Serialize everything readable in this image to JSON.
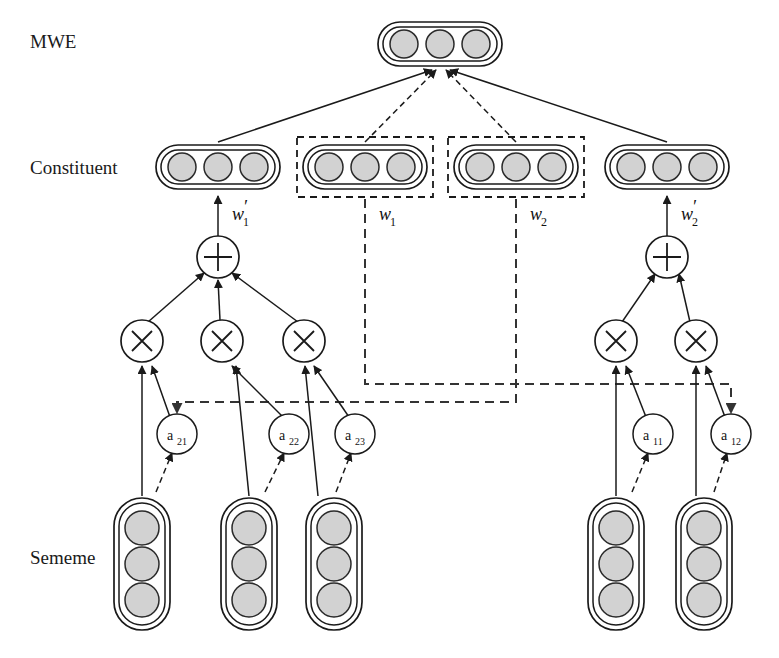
{
  "figure": {
    "background": "#ffffff",
    "width": 779,
    "height": 658
  },
  "colors": {
    "unit_fill": "#d2d2d2",
    "unit_stroke": "#2a2a2a",
    "line": "#1a1a1a",
    "dashed_route": "#333333",
    "background": "#ffffff"
  },
  "row_labels": {
    "mwe": "MWE",
    "constituent": "Constituent",
    "sememe": "Sememe"
  },
  "weights": {
    "w1_prime": {
      "base": "w",
      "prime": "′",
      "sub": "1",
      "full": "w′1"
    },
    "w1": {
      "base": "w",
      "prime": "",
      "sub": "1",
      "full": "w1"
    },
    "w2": {
      "base": "w",
      "prime": "",
      "sub": "2",
      "full": "w2"
    },
    "w2_prime": {
      "base": "w",
      "prime": "′",
      "sub": "2",
      "full": "w′2"
    }
  },
  "attention_nodes": [
    {
      "id": "a21",
      "base": "a",
      "sub": "21",
      "cx": 177,
      "cy": 434
    },
    {
      "id": "a22",
      "base": "a",
      "sub": "22",
      "cx": 289,
      "cy": 434
    },
    {
      "id": "a23",
      "base": "a",
      "sub": "23",
      "cx": 355,
      "cy": 434
    },
    {
      "id": "a11",
      "base": "a",
      "sub": "11",
      "cx": 653,
      "cy": 434
    },
    {
      "id": "a12",
      "base": "a",
      "sub": "12",
      "cx": 731,
      "cy": 434
    }
  ],
  "mwe_node": {
    "name": "mwe-vector",
    "cx": 440,
    "cy": 44,
    "units": 3
  },
  "constituent_nodes": [
    {
      "name": "constituent-left-composed",
      "cx": 218,
      "cy": 167,
      "units": 3,
      "boxed": false
    },
    {
      "name": "constituent-w1",
      "cx": 365,
      "cy": 167,
      "units": 3,
      "boxed": true
    },
    {
      "name": "constituent-w2",
      "cx": 516,
      "cy": 167,
      "units": 3,
      "boxed": true
    },
    {
      "name": "constituent-right-composed",
      "cx": 667,
      "cy": 167,
      "units": 3,
      "boxed": false
    }
  ],
  "sememe_nodes": [
    {
      "name": "sememe-vector-1",
      "cx": 142,
      "cy": 570,
      "units": 3
    },
    {
      "name": "sememe-vector-2",
      "cx": 249,
      "cy": 570,
      "units": 3
    },
    {
      "name": "sememe-vector-3",
      "cx": 334,
      "cy": 570,
      "units": 3
    },
    {
      "name": "sememe-vector-4",
      "cx": 616,
      "cy": 570,
      "units": 3
    },
    {
      "name": "sememe-vector-5",
      "cx": 704,
      "cy": 570,
      "units": 3
    }
  ],
  "sum_nodes": [
    {
      "name": "sum-left",
      "glyph": "+",
      "cx": 218,
      "cy": 257
    },
    {
      "name": "sum-right",
      "glyph": "+",
      "cx": 667,
      "cy": 257
    }
  ],
  "product_nodes": [
    {
      "name": "product-left-1",
      "glyph": "×",
      "cx": 142,
      "cy": 341
    },
    {
      "name": "product-left-2",
      "glyph": "×",
      "cx": 222,
      "cy": 341
    },
    {
      "name": "product-left-3",
      "glyph": "×",
      "cx": 304,
      "cy": 341
    },
    {
      "name": "product-right-1",
      "glyph": "×",
      "cx": 616,
      "cy": 341
    },
    {
      "name": "product-right-2",
      "glyph": "×",
      "cx": 696,
      "cy": 341
    }
  ],
  "legend_notes": {
    "solid_edge": "composition flow",
    "dashed_edge": "attention flow"
  }
}
